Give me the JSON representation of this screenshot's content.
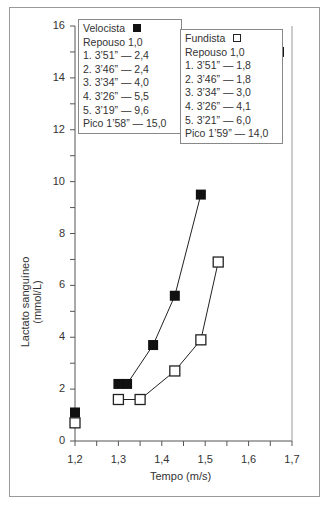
{
  "chart_data": {
    "type": "line",
    "title": "",
    "xlabel": "Tempo (m/s)",
    "ylabel": "Lactato sanguíneo (mmol/L)",
    "xlim": [
      1.2,
      1.7
    ],
    "ylim": [
      0,
      16
    ],
    "x_ticks": [
      "1,2",
      "1,3",
      "1,4",
      "1,5",
      "1,6",
      "1,7"
    ],
    "y_ticks": [
      "0",
      "2",
      "4",
      "6",
      "8",
      "10",
      "12",
      "14",
      "16"
    ],
    "grid": false,
    "series": [
      {
        "name": "Velocista",
        "marker": "filled-square",
        "color": "#111111",
        "points": [
          {
            "x": 1.2,
            "y": 1.1,
            "connected": false
          },
          {
            "x": 1.3,
            "y": 2.2,
            "connected": true
          },
          {
            "x": 1.32,
            "y": 2.2,
            "connected": true
          },
          {
            "x": 1.38,
            "y": 3.7,
            "connected": true
          },
          {
            "x": 1.43,
            "y": 5.6,
            "connected": true
          },
          {
            "x": 1.49,
            "y": 9.5,
            "connected": true
          },
          {
            "x": 1.67,
            "y": 15.0,
            "connected": false
          }
        ]
      },
      {
        "name": "Fundista",
        "marker": "open-square",
        "color": "#222222",
        "points": [
          {
            "x": 1.2,
            "y": 0.7,
            "connected": false
          },
          {
            "x": 1.3,
            "y": 1.6,
            "connected": true
          },
          {
            "x": 1.35,
            "y": 1.6,
            "connected": true
          },
          {
            "x": 1.43,
            "y": 2.7,
            "connected": true
          },
          {
            "x": 1.49,
            "y": 3.9,
            "connected": true
          },
          {
            "x": 1.53,
            "y": 6.9,
            "connected": true
          },
          {
            "x": 1.66,
            "y": 12.0,
            "connected": false
          }
        ]
      }
    ],
    "legends": [
      {
        "title": "Velocista",
        "symbol": "filled",
        "lines": [
          "Repouso 1,0",
          "1. 3’51” — 2,4",
          "2. 3’46” — 2,4",
          "3. 3’34” — 4,0",
          "4. 3’26” — 5,5",
          "5. 3’19” — 9,6",
          "Pico 1’58” — 15,0"
        ]
      },
      {
        "title": "Fundista",
        "symbol": "open",
        "lines": [
          "Repouso 1,0",
          "1. 3’51” — 1,8",
          "2. 3’46” — 1,8",
          "3. 3’34” — 3,0",
          "4. 3’26” — 4,1",
          "5. 3’21” — 6,0",
          "Pico 1’59” — 14,0"
        ]
      }
    ]
  }
}
